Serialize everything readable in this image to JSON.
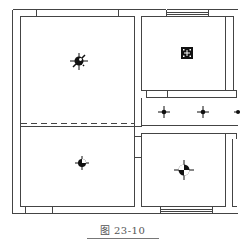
{
  "figure": {
    "caption": "图 23-10",
    "type": "floor-plan",
    "line_color": "#444444",
    "background": "#ffffff"
  },
  "rooms": [
    {
      "id": "left-upper-room",
      "fixture": "ceiling-light-splat"
    },
    {
      "id": "left-lower-room",
      "fixture": "ceiling-light-round"
    },
    {
      "id": "top-right-room",
      "fixture": "square-light-fixture"
    },
    {
      "id": "corridor",
      "fixture": "downlight-row",
      "count": 3
    },
    {
      "id": "bottom-right-room",
      "fixture": "ceiling-light-large-round"
    }
  ],
  "windows": [
    {
      "id": "top-window"
    },
    {
      "id": "bottom-window"
    }
  ]
}
